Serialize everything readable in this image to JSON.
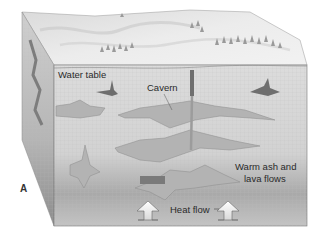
{
  "figure": {
    "panel_label": "A",
    "labels": {
      "water_table": "Water table",
      "cavern": "Cavern",
      "warm_ash_line1": "Warm ash and",
      "warm_ash_line2": "lava flows",
      "heat_flow": "Heat flow"
    }
  },
  "colors": {
    "block_fill": "#d4d4d4",
    "cavity_fill": "#b3b3b3",
    "cavity_dark": "#6e6e6e",
    "surface_fill": "#e3e3e3",
    "text": "#2a2a2a"
  }
}
